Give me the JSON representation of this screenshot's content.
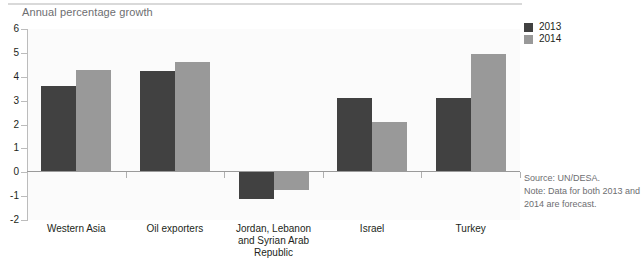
{
  "chart_data": {
    "type": "bar",
    "title": "Annual percentage growth",
    "xlabel": "",
    "ylabel": "",
    "ylim": [
      -2,
      6
    ],
    "yticks": [
      6,
      5,
      4,
      3,
      2,
      1,
      0,
      -1,
      -2
    ],
    "ytick_labels": [
      "6",
      "5",
      "4",
      "3",
      "2",
      "1",
      "0",
      "-1",
      "-2"
    ],
    "grid": false,
    "legend_position": "top-right",
    "categories": [
      "Western Asia",
      "Oil exporters",
      "Jordan, Lebanon\nand Syrian Arab\nRepublic",
      "Israel",
      "Turkey"
    ],
    "series": [
      {
        "name": "2013",
        "color": "#414141",
        "values": [
          3.6,
          4.25,
          -1.1,
          3.1,
          3.1
        ]
      },
      {
        "name": "2014",
        "color": "#999999",
        "values": [
          4.3,
          4.6,
          -0.75,
          2.1,
          4.95
        ]
      }
    ]
  },
  "legend": {
    "items": [
      {
        "label": "2013",
        "color": "#414141"
      },
      {
        "label": "2014",
        "color": "#999999"
      }
    ]
  },
  "footnotes": {
    "source_label": "Source:",
    "source_text": "UN/DESA.",
    "note_label": "Note:",
    "note_text": "Data for both 2013 and 2014 are forecast."
  },
  "colors": {
    "series_2013": "#414141",
    "series_2014": "#999999",
    "axis": "#9a9a9a",
    "title_text": "#6d6e71",
    "plot_background": "#fbfbfb"
  }
}
